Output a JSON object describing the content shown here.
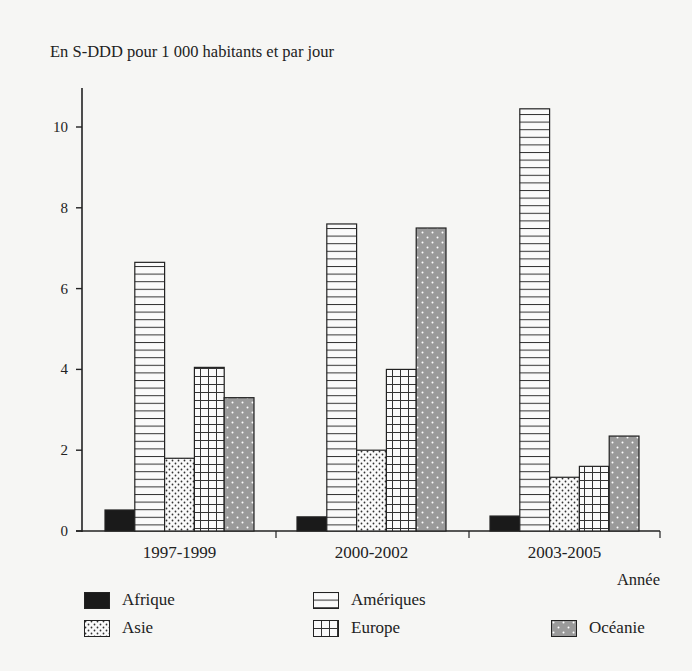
{
  "chart_data": {
    "type": "bar",
    "title": "En S-DDD pour 1 000 habitants et par jour",
    "xlabel": "Année",
    "ylabel": "En S-DDD pour 1 000 habitants et par jour",
    "categories": [
      "1997-1999",
      "2000-2002",
      "2003-2005"
    ],
    "series": [
      {
        "name": "Afrique",
        "pattern": "solid-black",
        "values": [
          0.52,
          0.35,
          0.37
        ]
      },
      {
        "name": "Amériques",
        "pattern": "horizontal-lines",
        "values": [
          6.65,
          7.6,
          10.45
        ]
      },
      {
        "name": "Asie",
        "pattern": "dots",
        "values": [
          1.8,
          2.0,
          1.33
        ]
      },
      {
        "name": "Europe",
        "pattern": "grid",
        "values": [
          4.05,
          4.0,
          1.6
        ]
      },
      {
        "name": "Océanie",
        "pattern": "gray-dotted",
        "values": [
          3.3,
          7.5,
          2.35
        ]
      }
    ],
    "yticks": [
      0,
      2,
      4,
      6,
      8,
      10
    ],
    "ylim": [
      0,
      11
    ],
    "grid": false,
    "legend_position": "bottom"
  },
  "colors": {
    "background": "#f6f6f4",
    "ink": "#222222",
    "oceanie_fill": "#9a9a9a"
  },
  "legend": {
    "afrique": "Afrique",
    "ameriques": "Amériques",
    "asie": "Asie",
    "europe": "Europe",
    "oceanie": "Océanie"
  }
}
